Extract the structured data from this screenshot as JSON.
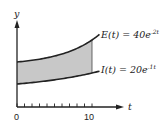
{
  "chart_data": {
    "type": "area",
    "title": "",
    "xlabel": "t",
    "ylabel": "y",
    "xlim": [
      0,
      11
    ],
    "x_ticks": [
      0,
      1,
      2,
      3,
      4,
      5,
      6,
      7,
      8,
      9,
      10
    ],
    "x_tick_labels": [
      "0",
      "10"
    ],
    "shaded_region": {
      "from": 0,
      "to": 10,
      "between": [
        "E(t)",
        "I(t)"
      ],
      "color": "#c8c8c8"
    },
    "series": [
      {
        "name": "E(t)",
        "label_text": "E(t) = 40e",
        "exponent": ".2t",
        "formula": "40e^{0.2t}",
        "coefficient": 40,
        "rate": 0.2
      },
      {
        "name": "I(t)",
        "label_text": "I(t) = 20e",
        "exponent": ".1t",
        "formula": "20e^{0.1t}",
        "coefficient": 20,
        "rate": 0.1
      }
    ],
    "grid": false,
    "legend": "none"
  }
}
